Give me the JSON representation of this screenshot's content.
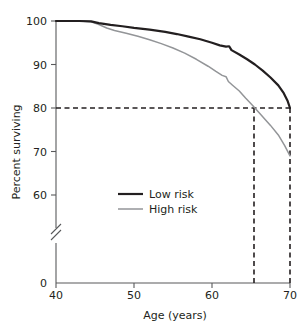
{
  "chart_data": {
    "type": "line",
    "title": "",
    "xlabel": "Age (years)",
    "ylabel": "Percent surviving",
    "xlim": [
      40,
      70
    ],
    "ylim": [
      0,
      100
    ],
    "y_axis_break": true,
    "y_axis_break_between": [
      0,
      60
    ],
    "grid": false,
    "legend_position": "center-left",
    "xticks": [
      40,
      50,
      60,
      70
    ],
    "xtick_labels": [
      "40",
      "50",
      "60",
      "70"
    ],
    "yticks": [
      0,
      60,
      70,
      80,
      90,
      100
    ],
    "ytick_labels": [
      "0",
      "60",
      "70",
      "80",
      "90",
      "100"
    ],
    "series": [
      {
        "name": "Low risk",
        "color": "#231f20",
        "linewidth": 2.2,
        "x": [
          40,
          43,
          44.5,
          45.5,
          47,
          48.5,
          50,
          52,
          54,
          55.5,
          57,
          58.5,
          60,
          61,
          61.8,
          62.2,
          62.5,
          63.5,
          64.5,
          65.5,
          66.5,
          67.5,
          68.5,
          69.2,
          69.7,
          70
        ],
        "y": [
          100,
          100,
          99.9,
          99.5,
          99.1,
          98.8,
          98.4,
          98.0,
          97.5,
          97.0,
          96.4,
          95.8,
          95.0,
          94.4,
          94.1,
          94.2,
          93.3,
          92.3,
          91.2,
          90.0,
          88.6,
          87.0,
          85.2,
          83.4,
          81.6,
          80.0
        ]
      },
      {
        "name": "High risk",
        "color": "#939598",
        "linewidth": 1.5,
        "x": [
          40,
          43,
          44.5,
          45.5,
          46.5,
          47.5,
          49,
          50.5,
          52,
          53.5,
          55,
          56.5,
          58,
          59.5,
          60.5,
          61.3,
          61.8,
          62.1,
          62.6,
          63.5,
          64.3,
          65.0,
          65.5,
          66.5,
          67.5,
          68.5,
          69.3,
          70
        ],
        "y": [
          100,
          100,
          99.8,
          99.2,
          98.4,
          97.8,
          97.2,
          96.5,
          95.7,
          94.8,
          93.8,
          92.6,
          91.2,
          89.6,
          88.4,
          87.5,
          87.2,
          86.1,
          85.3,
          83.9,
          82.3,
          81.0,
          80.0,
          78.0,
          76.0,
          73.8,
          71.4,
          69.0
        ]
      }
    ],
    "annotations": [
      {
        "name": "reference-line-80-horizontal",
        "type": "hline",
        "y": 80,
        "x_from": 40,
        "x_to": 70,
        "style": "dashed"
      },
      {
        "name": "reference-line-high-risk-vertical",
        "type": "vline",
        "x": 65.5,
        "y_from": 0,
        "y_to": 80,
        "style": "dashed"
      },
      {
        "name": "reference-line-low-risk-vertical",
        "type": "vline",
        "x": 70,
        "y_from": 0,
        "y_to": 80,
        "style": "dashed"
      }
    ]
  },
  "axes": {
    "x_title": "Age (years)",
    "y_title": "Percent surviving",
    "x_tick_labels": [
      "40",
      "50",
      "60",
      "70"
    ],
    "y_tick_labels": [
      "100",
      "90",
      "80",
      "70",
      "60",
      "0"
    ]
  },
  "legend": {
    "items": [
      {
        "label": "Low risk",
        "color": "#231f20"
      },
      {
        "label": "High risk",
        "color": "#939598"
      }
    ]
  },
  "colors": {
    "low_risk": "#231f20",
    "high_risk": "#939598",
    "axis": "#58595b",
    "dashed": "#231f20"
  }
}
